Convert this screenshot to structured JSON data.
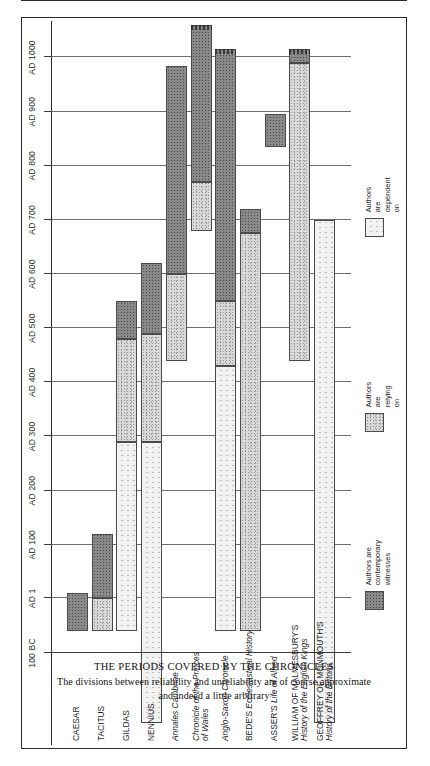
{
  "caption": {
    "title": "THE PERIODS COVERED BY THE CHRONICLES",
    "subtitle_line1": "The divisions between reliability and unreliability are of course approximate",
    "subtitle_line2": "and indeed a little arbitrary"
  },
  "legend": {
    "items": [
      {
        "key": "contemporary",
        "label": "Authors are\ncontemporary\nwitnesses",
        "fill": "#8a8a8a"
      },
      {
        "key": "good",
        "label": "Authors are relying on\ngood earlier sources or\ntraditions",
        "fill": "#d9d9d9"
      },
      {
        "key": "garbled",
        "label": "Authors are dependent on\ngarbled or unreliable\ntraditions",
        "fill": "#f2f2f2"
      }
    ]
  },
  "chart_data": {
    "type": "bar",
    "orientation": "horizontal-timeline-rotated",
    "title": "THE PERIODS COVERED BY THE CHRONICLES",
    "xlabel": "",
    "ylabel": "",
    "xlim": [
      -100,
      1060
    ],
    "grid": true,
    "legend_position": "right",
    "tick_values": [
      -100,
      1,
      100,
      200,
      300,
      400,
      500,
      600,
      700,
      800,
      900,
      1000
    ],
    "tick_labels": [
      "100 BC",
      "AD 1",
      "AD 100",
      "AD 200",
      "AD 300",
      "AD 400",
      "AD 500",
      "AD 600",
      "AD 700",
      "AD 800",
      "AD 900",
      "AD 1000"
    ],
    "categories": [
      "CAESAR",
      "TACITUS",
      "GILDAS",
      "NENNIUS",
      "Annales Cambriae",
      "Chronicle of the Princes of Wales",
      "Anglo-Saxon Chronicle",
      "BEDE'S Ecclesiastical History",
      "ASSER'S Life of Alfred",
      "WILLIAM OF MALMESBURY'S History of the English Kings",
      "GEOFFREY OF MONMOUTH'S History of the Britons"
    ],
    "series": [
      {
        "name": "Authors are contemporary witnesses",
        "key": "contemporary"
      },
      {
        "name": "Authors are relying on good earlier sources or traditions",
        "key": "good"
      },
      {
        "name": "Authors are dependent on garbled or unreliable traditions",
        "key": "garbled"
      }
    ],
    "bars": [
      {
        "label": "CAESAR",
        "start": -60,
        "end": 10,
        "open_end": false,
        "segments": [
          {
            "key": "contemporary",
            "from": -60,
            "to": 10
          }
        ]
      },
      {
        "label": "TACITUS",
        "start": -60,
        "end": 120,
        "open_end": false,
        "segments": [
          {
            "key": "good",
            "from": -60,
            "to": 1
          },
          {
            "key": "contemporary",
            "from": 1,
            "to": 120
          }
        ]
      },
      {
        "label": "GILDAS",
        "start": -60,
        "end": 550,
        "open_end": false,
        "segments": [
          {
            "key": "garbled",
            "from": -60,
            "to": 290
          },
          {
            "key": "good",
            "from": 290,
            "to": 480
          },
          {
            "key": "contemporary",
            "from": 480,
            "to": 550
          }
        ]
      },
      {
        "label": "NENNIUS",
        "start": -230,
        "end": 620,
        "open_end": false,
        "segments": [
          {
            "key": "garbled",
            "from": -230,
            "to": 290
          },
          {
            "key": "good",
            "from": 290,
            "to": 490
          },
          {
            "key": "contemporary",
            "from": 490,
            "to": 620
          }
        ]
      },
      {
        "label": "Annales Cambriae",
        "start": 440,
        "end": 985,
        "open_end": false,
        "segments": [
          {
            "key": "good",
            "from": 440,
            "to": 600
          },
          {
            "key": "contemporary",
            "from": 600,
            "to": 985
          }
        ]
      },
      {
        "label": "Chronicle of the Princes of Wales",
        "start": 680,
        "end": 1060,
        "open_end": true,
        "segments": [
          {
            "key": "good",
            "from": 680,
            "to": 770
          },
          {
            "key": "contemporary",
            "from": 770,
            "to": 1060
          }
        ]
      },
      {
        "label": "Anglo-Saxon Chronicle",
        "start": -60,
        "end": 1015,
        "open_end": true,
        "segments": [
          {
            "key": "garbled",
            "from": -60,
            "to": 430
          },
          {
            "key": "good",
            "from": 430,
            "to": 550
          },
          {
            "key": "contemporary",
            "from": 550,
            "to": 1015
          }
        ]
      },
      {
        "label": "BEDE'S Ecclesiastical History",
        "start": -60,
        "end": 720,
        "open_end": false,
        "segments": [
          {
            "key": "good",
            "from": -60,
            "to": 675
          },
          {
            "key": "contemporary",
            "from": 675,
            "to": 720
          }
        ]
      },
      {
        "label": "ASSER'S Life of Alfred",
        "start": 835,
        "end": 895,
        "open_end": false,
        "segments": [
          {
            "key": "contemporary",
            "from": 835,
            "to": 895
          }
        ]
      },
      {
        "label": "WILLIAM OF MALMESBURY'S History of the English Kings",
        "start": 440,
        "end": 1015,
        "open_end": true,
        "segments": [
          {
            "key": "good",
            "from": 440,
            "to": 990
          },
          {
            "key": "contemporary",
            "from": 990,
            "to": 1015
          }
        ]
      },
      {
        "label": "GEOFFREY OF MONMOUTH'S History of the Britons",
        "start": -230,
        "end": 700,
        "open_end": false,
        "segments": [
          {
            "key": "garbled",
            "from": -230,
            "to": 700
          }
        ]
      }
    ],
    "row_labels": [
      {
        "parts": [
          {
            "text": "CAESAR",
            "style": "caps"
          }
        ]
      },
      {
        "parts": [
          {
            "text": "TACITUS",
            "style": "caps"
          }
        ]
      },
      {
        "parts": [
          {
            "text": "GILDAS",
            "style": "caps"
          }
        ]
      },
      {
        "parts": [
          {
            "text": "NENNIUS",
            "style": "caps"
          }
        ]
      },
      {
        "parts": [
          {
            "text": "Annales Cambriae",
            "style": "it"
          }
        ]
      },
      {
        "parts": [
          {
            "text": "Chronicle of the Princes",
            "style": "it"
          },
          {
            "text": "of Wales",
            "style": "it"
          }
        ]
      },
      {
        "parts": [
          {
            "text": "Anglo-Saxon Chronicle",
            "style": "it"
          }
        ]
      },
      {
        "parts": [
          {
            "text": "BEDE'S  Ecclesiastical History",
            "style": "mixed"
          }
        ]
      },
      {
        "parts": [
          {
            "text": "ASSER'S  Life of Alfred",
            "style": "mixed"
          }
        ]
      },
      {
        "parts": [
          {
            "text": "WILLIAM OF MALMESBURY'S",
            "style": "caps"
          },
          {
            "text": "History of the English Kings",
            "style": "it"
          }
        ]
      },
      {
        "parts": [
          {
            "text": "GEOFFREY OF MONMOUTH'S",
            "style": "caps"
          },
          {
            "text": "History of the Britons",
            "style": "it"
          }
        ]
      }
    ]
  }
}
